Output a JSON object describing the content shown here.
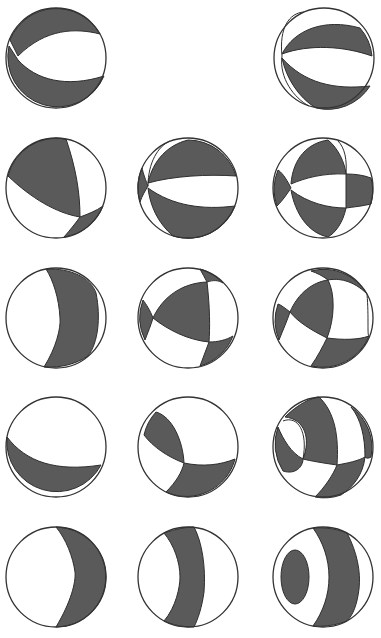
{
  "figure": {
    "title": "",
    "colors": {
      "compressional_fill": "#5a5a5a",
      "dilatational_fill": "#ffffff",
      "outline": "#333333"
    },
    "rows": 5,
    "columns": 3,
    "balls": [
      {
        "id": "r1c1",
        "row": 1,
        "col": 1,
        "present": true,
        "pattern": "reverse-lower-band"
      },
      {
        "id": "r1c2",
        "row": 1,
        "col": 2,
        "present": false,
        "pattern": "empty"
      },
      {
        "id": "r1c3",
        "row": 1,
        "col": 3,
        "present": true,
        "pattern": "striped-two-bands"
      },
      {
        "id": "r2c1",
        "row": 2,
        "col": 1,
        "present": true,
        "pattern": "upper-left-quadrant"
      },
      {
        "id": "r2c2",
        "row": 2,
        "col": 2,
        "present": true,
        "pattern": "two-bands-left-wedge"
      },
      {
        "id": "r2c3",
        "row": 2,
        "col": 3,
        "present": true,
        "pattern": "four-lobes"
      },
      {
        "id": "r3c1",
        "row": 3,
        "col": 1,
        "present": true,
        "pattern": "right-crescent-band"
      },
      {
        "id": "r3c2",
        "row": 3,
        "col": 2,
        "present": true,
        "pattern": "central-triangle"
      },
      {
        "id": "r3c3",
        "row": 3,
        "col": 3,
        "present": true,
        "pattern": "left-lobe-with-bands"
      },
      {
        "id": "r4c1",
        "row": 4,
        "col": 1,
        "present": true,
        "pattern": "lower-crescent"
      },
      {
        "id": "r4c2",
        "row": 4,
        "col": 2,
        "present": true,
        "pattern": "left-lobe-lower-band"
      },
      {
        "id": "r4c3",
        "row": 4,
        "col": 3,
        "present": true,
        "pattern": "oval-inset-with-bands"
      },
      {
        "id": "r5c1",
        "row": 5,
        "col": 1,
        "present": true,
        "pattern": "right-crescent"
      },
      {
        "id": "r5c2",
        "row": 5,
        "col": 2,
        "present": true,
        "pattern": "vertical-band"
      },
      {
        "id": "r5c3",
        "row": 5,
        "col": 3,
        "present": true,
        "pattern": "left-oval-and-band"
      }
    ]
  }
}
